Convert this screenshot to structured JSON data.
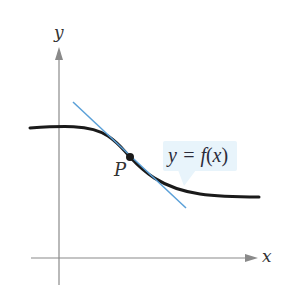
{
  "diagram": {
    "axes": {
      "x_label": "x",
      "y_label": "y",
      "axis_color": "#7a7a7a",
      "origin_px": [
        59,
        258
      ]
    },
    "curve": {
      "label_prefix": "y = ",
      "label_func": "f",
      "label_open": "(",
      "label_var": "x",
      "label_close": ")",
      "color": "#1a1a1a",
      "description": "decreasing smooth sigmoid-like curve, flat on the left, descending through P, leveling off on the right"
    },
    "tangent_line": {
      "color": "#5aa0d8",
      "from_px": [
        73,
        102
      ],
      "to_px": [
        186,
        208
      ]
    },
    "point": {
      "label": "P",
      "px": [
        130,
        157
      ],
      "color": "#1a1a1a"
    },
    "callout": {
      "background": "#e8f4fb"
    }
  }
}
